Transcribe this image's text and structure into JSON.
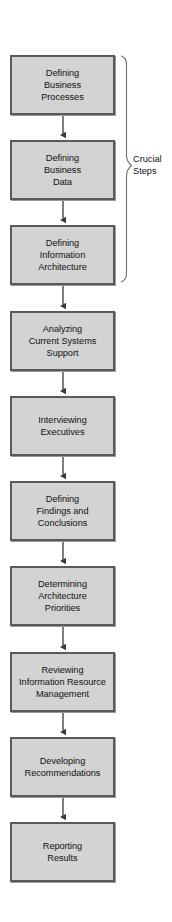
{
  "diagram": {
    "type": "flowchart",
    "orientation": "vertical",
    "background_color": "#ffffff",
    "node_fill_color": "#d3d3d3",
    "node_border_color": "#5a5a5a",
    "connector_color": "#3a3a3a",
    "text_color": "#111111",
    "nodes": [
      {
        "id": "node-1",
        "label": "Defining\nBusiness\nProcesses"
      },
      {
        "id": "node-2",
        "label": "Defining\nBusiness\nData"
      },
      {
        "id": "node-3",
        "label": "Defining\nInformation\nArchitecture"
      },
      {
        "id": "node-4",
        "label": "Analyzing\nCurrent Systems\nSupport"
      },
      {
        "id": "node-5",
        "label": "Interviewing\nExecutives"
      },
      {
        "id": "node-6",
        "label": "Defining\nFindings and\nConclusions"
      },
      {
        "id": "node-7",
        "label": "Determining\nArchitecture\nPriorities"
      },
      {
        "id": "node-8",
        "label": "Reviewing\nInformation Resource\nManagement"
      },
      {
        "id": "node-9",
        "label": "Developing\nRecommendations"
      },
      {
        "id": "node-10",
        "label": "Reporting\nResults"
      }
    ],
    "annotation": {
      "id": "crucial-steps",
      "label": "Crucial\nSteps",
      "spans_nodes": [
        "node-1",
        "node-2",
        "node-3"
      ],
      "marker": "right-curly-brace"
    }
  }
}
